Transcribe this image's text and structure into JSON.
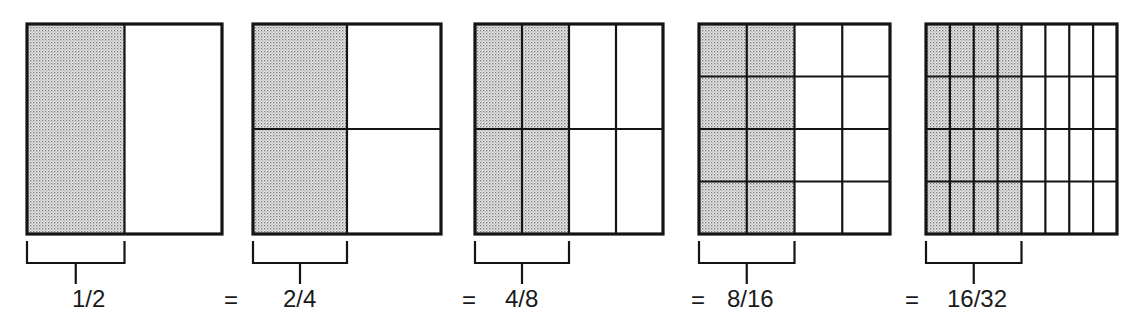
{
  "diagram": {
    "colors": {
      "ink": "#141414",
      "shade_dot": "#8a8a8a",
      "shade_bg": "#e4e4e4",
      "paper": "#ffffff"
    },
    "equals_sign": "=",
    "panels": [
      {
        "label": "1/2",
        "cols": 2,
        "rows": 1,
        "shaded_cols": 1,
        "x": 27,
        "w": 195,
        "label_x": 72,
        "eq_x": null
      },
      {
        "label": "2/4",
        "cols": 2,
        "rows": 2,
        "shaded_cols": 1,
        "x": 253,
        "w": 188,
        "label_x": 283,
        "eq_x": 224
      },
      {
        "label": "4/8",
        "cols": 4,
        "rows": 2,
        "shaded_cols": 2,
        "x": 475,
        "w": 188,
        "label_x": 505,
        "eq_x": 462
      },
      {
        "label": "8/16",
        "cols": 4,
        "rows": 4,
        "shaded_cols": 2,
        "x": 699,
        "w": 191,
        "label_x": 727,
        "eq_x": 691
      },
      {
        "label": "16/32",
        "cols": 8,
        "rows": 4,
        "shaded_cols": 4,
        "x": 926,
        "w": 191,
        "label_x": 947,
        "eq_x": 905
      }
    ],
    "box_top": 24,
    "box_bottom": 234
  }
}
